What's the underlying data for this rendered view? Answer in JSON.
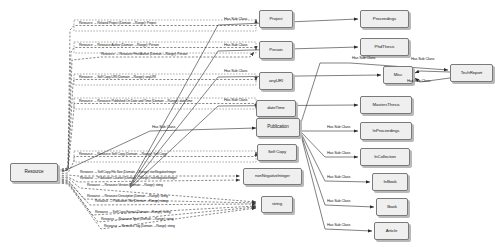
{
  "diagram": {
    "style": {
      "node_fill": "#efefef",
      "node_border": "#7a7a7a",
      "edge_solid": "#2b2b2b",
      "edge_dashed": "#3a3a3a",
      "text": "#1a1a1a"
    },
    "nodes": [
      {
        "id": "resource",
        "label": "Resource",
        "x": 10,
        "y": 163,
        "w": 48,
        "h": 19,
        "fs": 4.6
      },
      {
        "id": "project",
        "label": "Project",
        "x": 259,
        "y": 10,
        "w": 34,
        "h": 18,
        "fs": 4.4
      },
      {
        "id": "person",
        "label": "Person",
        "x": 259,
        "y": 41,
        "w": 34,
        "h": 18,
        "fs": 4.4
      },
      {
        "id": "anyuri",
        "label": "anyURI",
        "x": 259,
        "y": 72,
        "w": 34,
        "h": 18,
        "fs": 4.4
      },
      {
        "id": "datetime",
        "label": "dateTime",
        "x": 256,
        "y": 100,
        "w": 40,
        "h": 17,
        "fs": 4.4
      },
      {
        "id": "publication",
        "label": "Publication",
        "x": 256,
        "y": 118,
        "w": 44,
        "h": 19,
        "fs": 4.6
      },
      {
        "id": "selfcopy",
        "label": "Self Copy",
        "x": 257,
        "y": 144,
        "w": 40,
        "h": 17,
        "fs": 4.4
      },
      {
        "id": "nonnegint",
        "label": "nonNegativeInteger",
        "x": 243,
        "y": 168,
        "w": 59,
        "h": 17,
        "fs": 4.2
      },
      {
        "id": "string",
        "label": "string",
        "x": 261,
        "y": 196,
        "w": 32,
        "h": 17,
        "fs": 4.4
      },
      {
        "id": "proceedings",
        "label": "Proceedings",
        "x": 360,
        "y": 10,
        "w": 49,
        "h": 18,
        "fs": 4.4
      },
      {
        "id": "phdthesis",
        "label": "PhdThesis",
        "x": 360,
        "y": 38,
        "w": 49,
        "h": 18,
        "fs": 4.4
      },
      {
        "id": "misc",
        "label": "Misc",
        "x": 383,
        "y": 66,
        "w": 30,
        "h": 18,
        "fs": 4.4
      },
      {
        "id": "techreport",
        "label": "TechReport",
        "x": 450,
        "y": 64,
        "w": 43,
        "h": 18,
        "fs": 4.4
      },
      {
        "id": "mastersthesis",
        "label": "MastersThesis",
        "x": 360,
        "y": 96,
        "w": 52,
        "h": 18,
        "fs": 4.4
      },
      {
        "id": "inproceedings",
        "label": "InProceedings",
        "x": 360,
        "y": 122,
        "w": 52,
        "h": 18,
        "fs": 4.4
      },
      {
        "id": "incollection",
        "label": "InCollection",
        "x": 360,
        "y": 148,
        "w": 50,
        "h": 18,
        "fs": 4.4
      },
      {
        "id": "inbook",
        "label": "InBook",
        "x": 372,
        "y": 173,
        "w": 36,
        "h": 18,
        "fs": 4.4
      },
      {
        "id": "book",
        "label": "Book",
        "x": 376,
        "y": 198,
        "w": 32,
        "h": 18,
        "fs": 4.4
      },
      {
        "id": "article",
        "label": "Article",
        "x": 374,
        "y": 222,
        "w": 35,
        "h": 18,
        "fs": 4.4
      }
    ],
    "property_edges": [
      {
        "id": "p-related-project",
        "label": "Resource → Related Project (Domain →Range): Project",
        "x": 79,
        "y": 25.5,
        "fs": 3.5,
        "box": {
          "x": 74,
          "y": 20,
          "w": 182,
          "h": 11
        }
      },
      {
        "id": "p-resource-author",
        "label": "Resource → Resource Author (Domain →Range): Person",
        "x": 79,
        "y": 47.5,
        "fs": 3.5,
        "box": {
          "x": 74,
          "y": 42,
          "w": 182,
          "h": 11
        }
      },
      {
        "id": "p-first-author",
        "label": "Resource → Resource First Author (Domain →Range): Person",
        "x": 101,
        "y": 56.5,
        "fs": 3.5,
        "box": null
      },
      {
        "id": "p-self-copy-uri",
        "label": "Resource → Self Copy URI (Domain →Range): anyURI",
        "x": 79,
        "y": 79.5,
        "fs": 3.5,
        "box": {
          "x": 74,
          "y": 74,
          "w": 182,
          "h": 11
        }
      },
      {
        "id": "p-published-on",
        "label": "Resource → Resource Published On Date and Time (Domain →Range): dateTime",
        "x": 79,
        "y": 103.5,
        "fs": 3.5,
        "box": {
          "x": 74,
          "y": 98,
          "w": 182,
          "h": 11
        }
      },
      {
        "id": "p-resource-self-copy",
        "label": "Resource → Resource Self Copy (Domain →Range): Self Copy",
        "x": 79,
        "y": 156.5,
        "fs": 3.5,
        "box": {
          "x": 74,
          "y": 151,
          "w": 182,
          "h": 11
        }
      },
      {
        "id": "p-file-size",
        "label": "Resource → Self Copy File Size (Domain →Range): nonNegativeInteger",
        "x": 80,
        "y": 174,
        "fs": 3.4,
        "box": null
      },
      {
        "id": "p-publication-course",
        "label": "Resource → Publication Counter (Domain →Range): nonNegativeInteger",
        "x": 80,
        "y": 180.5,
        "fs": 3.4,
        "box": null
      },
      {
        "id": "p-resource-version",
        "label": "Resource → Resource Version (Domain →Range): string",
        "x": 87,
        "y": 187,
        "fs": 3.4,
        "box": null
      },
      {
        "id": "p-resource-desc",
        "label": "Resource → Resource Description (Domain →Range): string",
        "x": 87,
        "y": 198,
        "fs": 3.4,
        "box": null
      },
      {
        "id": "p-publication-title",
        "label": "Resource → Publication Title (Domain →Range): string",
        "x": 95,
        "y": 203.5,
        "fs": 3.4,
        "box": null
      },
      {
        "id": "p-self-copy-format",
        "label": "Resource → Self Copy Format (Domain →Range): string",
        "x": 95,
        "y": 214,
        "fs": 3.4,
        "box": null
      },
      {
        "id": "p-resource-type",
        "label": "Resource → Resource Type (Domain →Range): string",
        "x": 101,
        "y": 221,
        "fs": 3.4,
        "box": null
      },
      {
        "id": "p-resource-tag",
        "label": "Resource → Resource Tag (Domain →Range): string",
        "x": 104,
        "y": 228,
        "fs": 3.4,
        "box": null
      }
    ],
    "subclass_edges": [
      {
        "id": "sc-publication",
        "label": "Has Sub Class",
        "x": 152,
        "y": 130,
        "fs": 3.8
      },
      {
        "id": "sc-proceedings",
        "label": "Has Sub Class",
        "x": 224,
        "y": 22,
        "fs": 3.8
      },
      {
        "id": "sc-phdthesis",
        "label": "Has Sub Class",
        "x": 224,
        "y": 48,
        "fs": 3.8
      },
      {
        "id": "sc-misc-top",
        "label": "Has Sub Class",
        "x": 352,
        "y": 61,
        "fs": 3.8
      },
      {
        "id": "sc-misc",
        "label": "Has Sub Class",
        "x": 224,
        "y": 74,
        "fs": 3.8
      },
      {
        "id": "sc-mastersthesis",
        "label": "Has Sub Class",
        "x": 224,
        "y": 103,
        "fs": 3.8
      },
      {
        "id": "sc-techreport-in",
        "label": "Has Sub Class",
        "x": 411,
        "y": 62,
        "fs": 3.8
      },
      {
        "id": "sc-techreport-out",
        "label": "Has Sub Class",
        "x": 407,
        "y": 84,
        "fs": 3.8
      },
      {
        "id": "sc-inproceedings",
        "label": "Has Sub Class",
        "x": 327,
        "y": 130,
        "fs": 3.8
      },
      {
        "id": "sc-incollection",
        "label": "Has Sub Class",
        "x": 327,
        "y": 156,
        "fs": 3.8
      },
      {
        "id": "sc-inbook",
        "label": "Has Sub Class",
        "x": 327,
        "y": 180,
        "fs": 3.8
      },
      {
        "id": "sc-book",
        "label": "Has Sub Class",
        "x": 327,
        "y": 204,
        "fs": 3.8
      },
      {
        "id": "sc-article",
        "label": "Has Sub Class",
        "x": 327,
        "y": 228,
        "fs": 3.8
      }
    ]
  }
}
